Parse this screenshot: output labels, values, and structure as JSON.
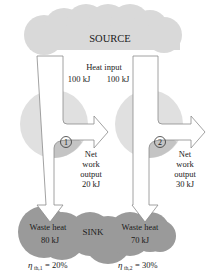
{
  "source": {
    "label": "SOURCE",
    "color": "#d9d9d9"
  },
  "heat_input": {
    "label": "Heat input",
    "engine1": "100 kJ",
    "engine2": "100 kJ"
  },
  "engines": [
    {
      "id": "1",
      "net_work": {
        "line1": "Net",
        "line2": "work",
        "line3": "output",
        "value": "20 kJ"
      },
      "waste_heat": {
        "label": "Waste heat",
        "value": "80 kJ"
      },
      "efficiency": {
        "symbol": "η",
        "subscript": "th,1",
        "value": "= 20%"
      }
    },
    {
      "id": "2",
      "net_work": {
        "line1": "Net",
        "line2": "work",
        "line3": "output",
        "value": "30 kJ"
      },
      "waste_heat": {
        "label": "Waste heat",
        "value": "70 kJ"
      },
      "efficiency": {
        "symbol": "η",
        "subscript": "th,2",
        "value": "= 30%"
      }
    }
  ],
  "sink": {
    "label": "SINK",
    "color": "#9a9a9a"
  },
  "colors": {
    "engine_fill": "#e0e0e0",
    "engine_dark": "#c4c4c4",
    "arrow_stroke": "#8a8a8a"
  }
}
